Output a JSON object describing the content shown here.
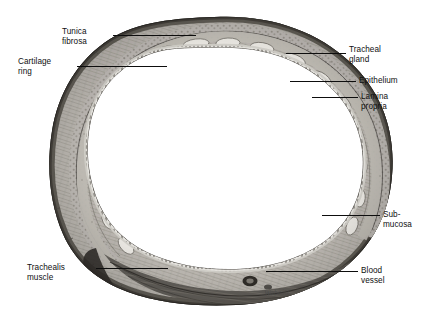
{
  "figure": {
    "specimen": "trachea",
    "palette": {
      "background": "#ffffff",
      "lumen": "#ffffff",
      "tissue_light": "#c9c6c0",
      "tissue_mid": "#8e8a84",
      "tissue_dark": "#4a4742",
      "outline": "#2b2926",
      "leader_line": "#0d0d0d",
      "label_text": "#101010"
    },
    "signature": "Wabnitz"
  },
  "labels": [
    {
      "id": "tunica-fibrosa",
      "lines": [
        "Tunica",
        "fibrosa"
      ],
      "text": "Tunica fibrosa"
    },
    {
      "id": "cartilage-ring",
      "lines": [
        "Cartilage",
        "ring"
      ],
      "text": "Cartilage ring"
    },
    {
      "id": "tracheal-gland",
      "lines": [
        "Tracheal",
        "gland"
      ],
      "text": "Tracheal gland"
    },
    {
      "id": "epithelium",
      "lines": [
        "Epithelium"
      ],
      "text": "Epithelium"
    },
    {
      "id": "lamina-propria",
      "lines": [
        "Lamina",
        "propria"
      ],
      "text": "Lamina propria"
    },
    {
      "id": "submucosa",
      "lines": [
        "Sub-",
        "mucosa"
      ],
      "text": "Sub-mucosa"
    },
    {
      "id": "blood-vessel",
      "lines": [
        "Blood",
        "vessel"
      ],
      "text": "Blood vessel"
    },
    {
      "id": "trachealis-muscle",
      "lines": [
        "Trachealis",
        "muscle"
      ],
      "text": "Trachealis muscle"
    }
  ]
}
